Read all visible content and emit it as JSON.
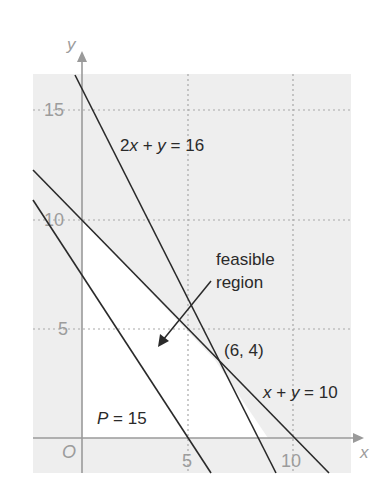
{
  "diagram": {
    "type": "linear-programming-graph",
    "axes": {
      "x_label": "x",
      "y_label": "y",
      "origin_label": "O",
      "x_ticks": [
        "5",
        "10"
      ],
      "y_ticks": [
        "5",
        "10",
        "15"
      ]
    },
    "lines": [
      {
        "id": "constraint-1",
        "equation": "2x + y = 16",
        "label_parts": [
          "2",
          "x",
          " + ",
          "y",
          " = 16"
        ]
      },
      {
        "id": "constraint-2",
        "equation": "x + y = 10",
        "label_parts": [
          "x",
          " + ",
          "y",
          " = 10"
        ]
      },
      {
        "id": "objective",
        "equation": "P = 15",
        "label_parts": [
          "P",
          " = 15"
        ]
      }
    ],
    "annotations": {
      "region_line1": "feasible",
      "region_line2": "region",
      "vertex": "(6, 4)"
    },
    "colors": {
      "panel": "#eeeeee",
      "feasible": "#ffffff",
      "grid": "#a8a8a8",
      "axis": "#9a9a9a",
      "line": "#2a2a2a"
    }
  }
}
